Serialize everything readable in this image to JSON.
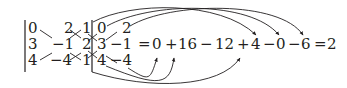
{
  "matrix": {
    "rows": [
      [
        "0",
        "2",
        "1"
      ],
      [
        "3",
        "−1",
        "2"
      ],
      [
        "4",
        "−4",
        "1"
      ]
    ]
  },
  "augmented_columns": {
    "rows": [
      [
        "0",
        "2"
      ],
      [
        "3",
        "−1"
      ],
      [
        "4",
        "−4"
      ]
    ]
  },
  "equation": {
    "equals1": "=",
    "terms": [
      "0",
      "+",
      "16",
      "−",
      "12",
      "+",
      "4",
      "−",
      "0",
      "−",
      "6"
    ],
    "equals2": "=",
    "result": "2"
  },
  "icons": {
    "diagonal_lines": "cross-line-icon",
    "curved_arrows": "curved-arrow-icon"
  },
  "colors": {
    "ink": "#231f20",
    "background": "#ffffff"
  }
}
